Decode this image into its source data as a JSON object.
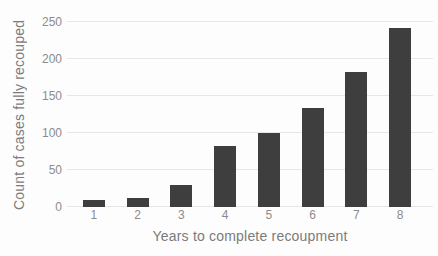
{
  "chart_data": {
    "type": "bar",
    "title": "",
    "xlabel": "Years to complete recoupment",
    "ylabel": "Count of cases fully recouped",
    "categories": [
      "1",
      "2",
      "3",
      "4",
      "5",
      "6",
      "7",
      "8"
    ],
    "values": [
      10,
      12,
      30,
      82,
      100,
      134,
      182,
      242
    ],
    "ylim": [
      0,
      250
    ],
    "yticks": [
      0,
      50,
      100,
      150,
      200,
      250
    ],
    "grid": "horizontal",
    "legend": "none",
    "colors": {
      "bar": "#3e3e3e",
      "gridline": "#e7e7e7",
      "tick_label": "#8c8c8c",
      "axis_title": "#7b7b7b",
      "background": "#fdfdfd"
    }
  }
}
